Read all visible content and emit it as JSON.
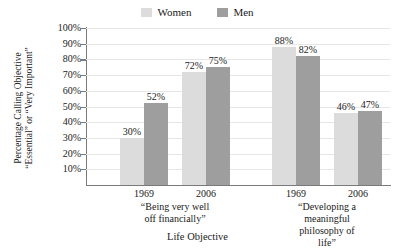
{
  "chart_data": {
    "type": "bar",
    "title": "",
    "xlabel": "Life Objective",
    "ylabel": "Percentage Calling Objective \"Essential\" or \"Very Important\"",
    "ylabel_line1": "Percentage Calling Objective",
    "ylabel_line2": "“Essential” or “Very Important”",
    "ylim": [
      0,
      100
    ],
    "ytick_labels": [
      "100%",
      "90%",
      "80%",
      "70%",
      "60%",
      "50%",
      "40%",
      "30%",
      "20%",
      "10%"
    ],
    "ytick_values": [
      100,
      90,
      80,
      70,
      60,
      50,
      40,
      30,
      20,
      10
    ],
    "grid": true,
    "grid_axis": "y",
    "legend_position": "top-center",
    "categories": [
      "1969",
      "2006",
      "1969",
      "2006"
    ],
    "groups": [
      {
        "label_line1": "“Being very well",
        "label_line2": "off financially”",
        "label": "“Being very well off financially”",
        "years": [
          {
            "year": "1969",
            "women": 30,
            "men": 52,
            "women_label": "30%",
            "men_label": "52%"
          },
          {
            "year": "2006",
            "women": 72,
            "men": 75,
            "women_label": "72%",
            "men_label": "75%"
          }
        ]
      },
      {
        "label_line1": "“Developing a meaningful",
        "label_line2": "philosophy of life”",
        "label": "“Developing a meaningful philosophy of life”",
        "years": [
          {
            "year": "1969",
            "women": 88,
            "men": 82,
            "women_label": "88%",
            "men_label": "82%"
          },
          {
            "year": "2006",
            "women": 46,
            "men": 47,
            "women_label": "46%",
            "men_label": "47%"
          }
        ]
      }
    ],
    "series": [
      {
        "name": "Women",
        "color": "#dcdcdc",
        "values": [
          30,
          72,
          88,
          46
        ]
      },
      {
        "name": "Men",
        "color": "#9e9e9e",
        "values": [
          52,
          75,
          82,
          47
        ]
      }
    ]
  },
  "legend": {
    "items": [
      {
        "label": "Women",
        "color": "#dcdcdc"
      },
      {
        "label": "Men",
        "color": "#9e9e9e"
      }
    ]
  },
  "colors": {
    "women": "#dcdcdc",
    "men": "#9e9e9e",
    "axis": "#7a7a7a",
    "grid": "#e6e6e6",
    "text": "#1a1a1a",
    "background": "#ffffff"
  }
}
